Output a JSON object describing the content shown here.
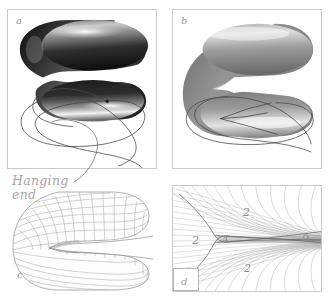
{
  "figure": {
    "background_color": "#ffffff",
    "border_color": "#c9c9c9",
    "ink_color": "#555555",
    "label_color": "#9a9a9a"
  },
  "panels": [
    {
      "id": "a",
      "label": "a",
      "caption": "",
      "bordered": true,
      "content": "dark glossy C-shaped tube above an open outline curve with a hanging free end"
    },
    {
      "id": "b",
      "label": "b",
      "caption": "",
      "bordered": true,
      "content": "mid-gray C-shaped tube with merged cusp above a closed outline curve with a cusp triangle"
    },
    {
      "id": "c",
      "label": "c",
      "caption": "",
      "bordered": false,
      "content": "wireframe quad-mesh C-shaped tube"
    },
    {
      "id": "d",
      "label": "d",
      "caption": "",
      "bordered": true,
      "content": "dense line-field caustic with cusp, regions labelled by preimage count"
    }
  ],
  "annotations": [
    {
      "id": "hanging-end",
      "text": "Hanging\nend",
      "color": "#a6a6a6",
      "points_to": "panel-a-curve-free-end"
    }
  ],
  "region_labels": [
    {
      "id": "d-left",
      "text": "2",
      "panel": "d"
    },
    {
      "id": "d-top",
      "text": "2",
      "panel": "d"
    },
    {
      "id": "d-center",
      "text": "4",
      "panel": "d"
    },
    {
      "id": "d-bottom",
      "text": "2",
      "panel": "d"
    },
    {
      "id": "d-right",
      "text": "0",
      "panel": "d"
    }
  ]
}
